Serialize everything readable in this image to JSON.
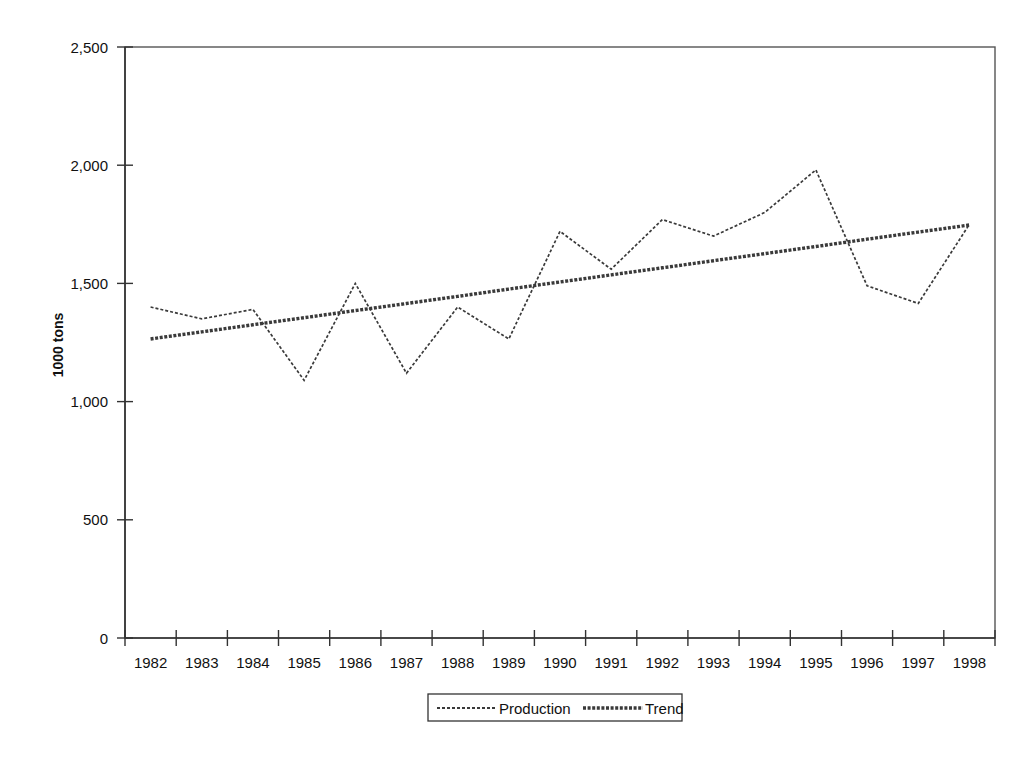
{
  "chart_data": {
    "type": "line",
    "title": "",
    "xlabel": "",
    "ylabel": "1000 tons",
    "ylim": [
      0,
      2500
    ],
    "yticks": [
      0,
      500,
      1000,
      1500,
      2000,
      2500
    ],
    "ytick_labels": [
      "0",
      "500",
      "1,000",
      "1,500",
      "2,000",
      "2,500"
    ],
    "categories": [
      1982,
      1983,
      1984,
      1985,
      1986,
      1987,
      1988,
      1989,
      1990,
      1991,
      1992,
      1993,
      1994,
      1995,
      1996,
      1997,
      1998
    ],
    "xtick_labels": [
      "1982",
      "1983",
      "1984",
      "1985",
      "1986",
      "1987",
      "1988",
      "1989",
      "1990",
      "1991",
      "1992",
      "1993",
      "1994",
      "1995",
      "1996",
      "1997",
      "1998"
    ],
    "grid": false,
    "legend_position": "bottom",
    "series": [
      {
        "name": "Production",
        "style": "dotted-thin",
        "values": [
          1400,
          1350,
          1390,
          1090,
          1500,
          1120,
          1400,
          1265,
          1720,
          1560,
          1770,
          1700,
          1800,
          1980,
          1490,
          1415,
          1750
        ]
      },
      {
        "name": "Trend",
        "style": "solid-thick",
        "values": [
          1265,
          1295,
          1325,
          1355,
          1385,
          1415,
          1445,
          1476,
          1506,
          1536,
          1566,
          1596,
          1626,
          1656,
          1687,
          1717,
          1747
        ]
      }
    ]
  },
  "legend": {
    "entries": [
      {
        "label": "Production"
      },
      {
        "label": "Trend"
      }
    ]
  },
  "axes": {
    "y_title": "1000 tons"
  },
  "colors": {
    "line": "#3a3a3a",
    "axis": "#333333",
    "frame": "#555555",
    "background": "#ffffff"
  }
}
